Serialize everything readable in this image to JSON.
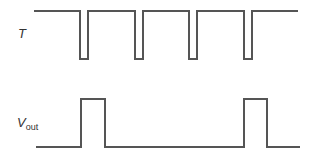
{
  "diagram": {
    "type": "timing-diagram",
    "stroke_color": "#555555",
    "signals": [
      {
        "name": "T",
        "label_main": "T",
        "label_sub": "",
        "high_y": 11,
        "low_y": 59,
        "start_x": 34,
        "end_x": 298,
        "idle_level": "high",
        "pulses": [
          [
            80,
            88
          ],
          [
            135,
            143
          ],
          [
            189,
            197
          ],
          [
            244,
            252
          ]
        ]
      },
      {
        "name": "Vout",
        "label_main": "V",
        "label_sub": "out",
        "high_y": 99,
        "low_y": 147,
        "start_x": 36,
        "end_x": 300,
        "idle_level": "low",
        "pulses": [
          [
            81,
            105
          ],
          [
            244,
            267
          ]
        ]
      }
    ]
  }
}
